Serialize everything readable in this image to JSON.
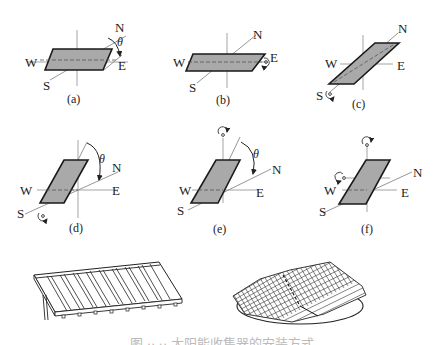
{
  "figure": {
    "compass": {
      "north": "N",
      "south": "S",
      "east": "E",
      "west": "W"
    },
    "angle_symbol": "θ",
    "subfigures": [
      {
        "id": "a",
        "label": "(a)",
        "note": "horizontal panel, tilt angle θ shown from N toward E"
      },
      {
        "id": "b",
        "label": "(b)",
        "note": "horizontal panel, rotation about E-W axis"
      },
      {
        "id": "c",
        "label": "(c)",
        "note": "panel aligned with N-S axis, rotation about N-S axis"
      },
      {
        "id": "d",
        "label": "(d)",
        "note": "tilted panel, angle θ, rotation about N-S axis"
      },
      {
        "id": "e",
        "label": "(e)",
        "note": "tilted panel, angle θ, rotation about vertical axis"
      },
      {
        "id": "f",
        "label": "(f)",
        "note": "tilted panel, rotation about vertical and E-W axes"
      }
    ],
    "illustrations": [
      {
        "id": "fixed-array",
        "note": "fixed tilted flat-plate collector array on support legs"
      },
      {
        "id": "tracking-array",
        "note": "gridded photovoltaic array on circular turntable"
      }
    ],
    "caption": "图 ·· ·· 太阳能收集器的安装方式"
  }
}
